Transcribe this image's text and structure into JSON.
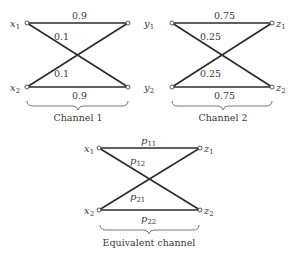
{
  "diagram": {
    "channel1": {
      "caption": "Channel 1",
      "inputs": [
        {
          "name": "x",
          "sub": "1"
        },
        {
          "name": "x",
          "sub": "2"
        }
      ],
      "outputs": [
        {
          "name": "y",
          "sub": "1"
        },
        {
          "name": "y",
          "sub": "2"
        }
      ],
      "edges": {
        "top": "0.9",
        "cross_down": "0.1",
        "cross_up": "0.1",
        "bottom": "0.9"
      }
    },
    "channel2": {
      "caption": "Channel 2",
      "outputs": [
        {
          "name": "z",
          "sub": "1"
        },
        {
          "name": "z",
          "sub": "2"
        }
      ],
      "edges": {
        "top": "0.75",
        "cross_down": "0.25",
        "cross_up": "0.25",
        "bottom": "0.75"
      }
    },
    "equivalent": {
      "caption": "Equivalent channel",
      "inputs": [
        {
          "name": "x",
          "sub": "1"
        },
        {
          "name": "x",
          "sub": "2"
        }
      ],
      "outputs": [
        {
          "name": "z",
          "sub": "1"
        },
        {
          "name": "z",
          "sub": "2"
        }
      ],
      "edges": {
        "top": {
          "name": "p",
          "sub": "11"
        },
        "cross_down": {
          "name": "p",
          "sub": "12"
        },
        "cross_up": {
          "name": "p",
          "sub": "21"
        },
        "bottom": {
          "name": "p",
          "sub": "22"
        }
      }
    }
  }
}
